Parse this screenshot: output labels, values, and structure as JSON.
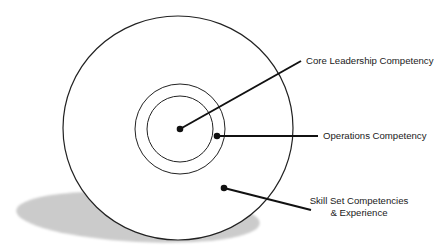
{
  "diagram": {
    "type": "concentric-competency-model",
    "colors": {
      "background": "#ffffff",
      "stroke": "#222222",
      "pointer": "#111111",
      "shadow": "#c8c8c8",
      "text": "#1a1a1a"
    },
    "rings": [
      {
        "name": "core-leadership-ring",
        "cx": 180,
        "cy": 129,
        "rx": 33,
        "ry": 33
      },
      {
        "name": "operations-ring",
        "cx": 180,
        "cy": 129,
        "rx": 45,
        "ry": 46
      },
      {
        "name": "skill-set-ring",
        "cx": 178,
        "cy": 128,
        "rx": 115,
        "ry": 112
      }
    ],
    "shadow": {
      "cx": 138,
      "cy": 217,
      "rx": 122,
      "ry": 25
    },
    "labels": {
      "core": {
        "text": "Core Leadership Competency",
        "dot": [
          180,
          129
        ],
        "line_end": [
          301,
          61
        ]
      },
      "operations": {
        "text": "Operations Competency",
        "dot": [
          217,
          136
        ],
        "line_end": [
          318,
          136
        ]
      },
      "skill": {
        "line1": "Skill Set Competencies",
        "line2": "& Experience",
        "dot": [
          224,
          188
        ],
        "line_end": [
          311,
          210
        ]
      }
    }
  }
}
